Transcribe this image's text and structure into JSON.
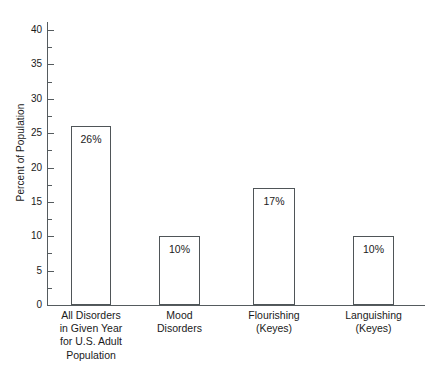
{
  "chart_data": {
    "type": "bar",
    "title": "",
    "subtitle": "",
    "xlabel": "",
    "ylabel": "Percent of Population",
    "ylim": [
      0,
      40
    ],
    "y_major_ticks": [
      0,
      5,
      10,
      15,
      20,
      25,
      30,
      35,
      40
    ],
    "y_minor_ticks": [
      2.5,
      7.5,
      12.5,
      17.5,
      22.5,
      27.5,
      32.5,
      37.5
    ],
    "y_tick_labels": [
      "0",
      "5",
      "10",
      "15",
      "20",
      "25",
      "30",
      "35",
      "40"
    ],
    "grid": false,
    "legend": false,
    "legend_position": "none",
    "categories": [
      "All Disorders\nin Given Year\nfor U.S. Adult\nPopulation",
      "Mood\nDisorders",
      "Flourishing\n(Keyes)",
      "Languishing\n(Keyes)"
    ],
    "values": [
      26,
      10,
      17,
      10
    ],
    "data_labels": [
      "26%",
      "10%",
      "17%",
      "10%"
    ],
    "colors": {
      "bar_fill": "#ffffff",
      "bar_edge": "#4f5558",
      "axis": "#555b5e",
      "text": "#1a1a1a",
      "background": "#ffffff"
    }
  },
  "axis": {
    "y_title": "Percent of Population"
  }
}
